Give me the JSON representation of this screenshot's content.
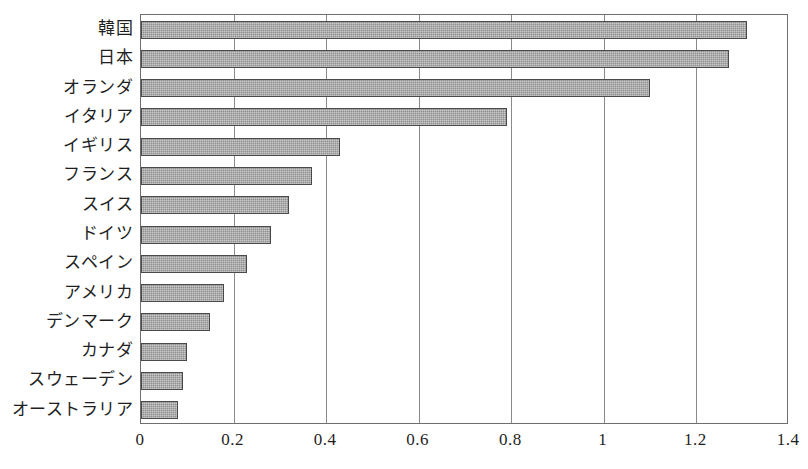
{
  "chart_data": {
    "type": "bar",
    "orientation": "horizontal",
    "title": "",
    "subtitle": "",
    "xlabel": "",
    "ylabel": "",
    "xlim": [
      0,
      1.4
    ],
    "xticks": [
      0,
      0.2,
      0.4,
      0.6,
      0.8,
      1,
      1.2,
      1.4
    ],
    "xtick_labels": [
      "0",
      "0.2",
      "0.4",
      "0.6",
      "0.8",
      "1",
      "1.2",
      "1.4"
    ],
    "grid": true,
    "grid_axis": "x",
    "legend": null,
    "categories": [
      "韓国",
      "日本",
      "オランダ",
      "イタリア",
      "イギリス",
      "フランス",
      "スイス",
      "ドイツ",
      "スペイン",
      "アメリカ",
      "デンマーク",
      "カナダ",
      "スウェーデン",
      "オーストラリア"
    ],
    "values": [
      1.31,
      1.27,
      1.1,
      0.79,
      0.43,
      0.37,
      0.32,
      0.28,
      0.23,
      0.18,
      0.15,
      0.1,
      0.09,
      0.08
    ],
    "bar_fill_color": "#8f8f8f",
    "bar_edge_color": "#4a4a4a",
    "axis_color": "#6e6e6e",
    "grid_color": "#8a8a8a",
    "background_color": "#ffffff"
  }
}
